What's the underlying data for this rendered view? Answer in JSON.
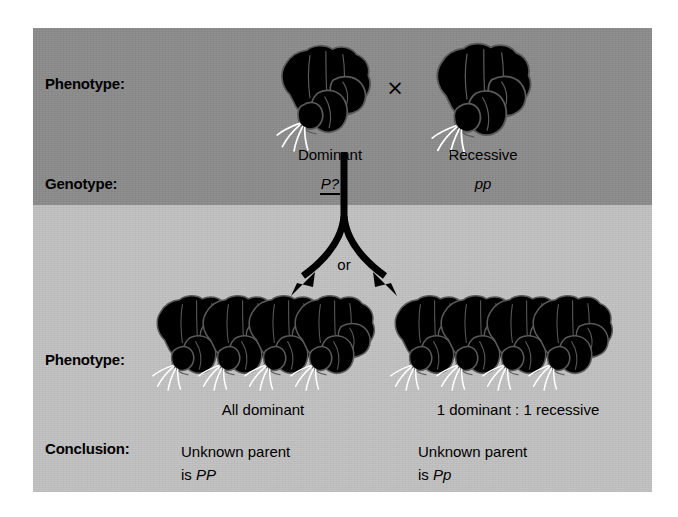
{
  "figure": {
    "type": "genetics-testcross-diagram",
    "colors": {
      "band_top": "#8c8c8c",
      "band_bottom": "#c2c2c2",
      "flower_dominant": "#c9c9c9",
      "flower_recessive": "#ffffff",
      "outline": "#5a5a5a",
      "arrow": "#000000",
      "text": "#000000",
      "page_background": "#ffffff"
    },
    "row_labels": {
      "phenotype_top": "Phenotype:",
      "genotype": "Genotype:",
      "phenotype_bottom": "Phenotype:",
      "conclusion": "Conclusion:"
    },
    "cross_symbol": "×",
    "or_label": "or",
    "parents": [
      {
        "name": "dominant-parent",
        "phenotype": "Dominant",
        "genotype": "P?",
        "genotype_underlined": true,
        "flower_color": "gray",
        "flower_count": 1
      },
      {
        "name": "recessive-parent",
        "phenotype": "Recessive",
        "genotype": "pp",
        "genotype_underlined": false,
        "flower_color": "white",
        "flower_count": 1
      }
    ],
    "outcomes": [
      {
        "name": "outcome-all-dominant",
        "phenotype_caption": "All dominant",
        "conclusion_line1": "Unknown parent",
        "conclusion_line2_prefix": "is ",
        "conclusion_genotype": "PP",
        "offspring_flower_colors": [
          "gray",
          "gray",
          "gray",
          "gray"
        ],
        "offspring_count": 4,
        "ratio_dominant": 4,
        "ratio_recessive": 0
      },
      {
        "name": "outcome-one-to-one",
        "phenotype_caption": "1 dominant : 1 recessive",
        "conclusion_line1": "Unknown parent",
        "conclusion_line2_prefix": "is ",
        "conclusion_genotype": "Pp",
        "offspring_flower_colors": [
          "white",
          "white",
          "gray",
          "gray"
        ],
        "offspring_count": 4,
        "ratio_dominant": 2,
        "ratio_recessive": 2
      }
    ]
  }
}
